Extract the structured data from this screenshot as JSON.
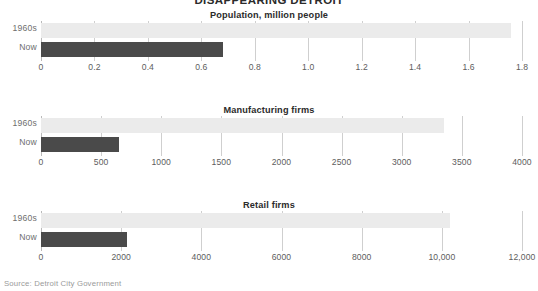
{
  "title": "DISAPPEARING DETROIT",
  "source": "Source: Detroit City Government",
  "series_labels": {
    "old": "1960s",
    "now": "Now"
  },
  "chart_data": [
    {
      "type": "bar",
      "orientation": "horizontal",
      "title": "Population, million people",
      "xlabel": "",
      "ylabel": "",
      "categories": [
        "1960s",
        "Now"
      ],
      "values": [
        1.76,
        0.68
      ],
      "series": [
        {
          "name": "1960s",
          "values": [
            1.76
          ],
          "color": "#ebebeb"
        },
        {
          "name": "Now",
          "values": [
            0.68
          ],
          "color": "#4a4a4a"
        }
      ],
      "xlim": [
        0,
        1.8
      ],
      "xticks": [
        0,
        0.2,
        0.4,
        0.6,
        0.8,
        1.0,
        1.2,
        1.4,
        1.6,
        1.8
      ],
      "xticklabels": [
        "0",
        "0.2",
        "0.4",
        "0.6",
        "0.8",
        "1.0",
        "1.2",
        "1.4",
        "1.6",
        "1.8"
      ],
      "grid": true,
      "legend": "none"
    },
    {
      "type": "bar",
      "orientation": "horizontal",
      "title": "Manufacturing firms",
      "xlabel": "",
      "ylabel": "",
      "categories": [
        "1960s",
        "Now"
      ],
      "values": [
        3350,
        650
      ],
      "series": [
        {
          "name": "1960s",
          "values": [
            3350
          ],
          "color": "#ebebeb"
        },
        {
          "name": "Now",
          "values": [
            650
          ],
          "color": "#4a4a4a"
        }
      ],
      "xlim": [
        0,
        4000
      ],
      "xticks": [
        0,
        500,
        1000,
        1500,
        2000,
        2500,
        3000,
        3500,
        4000
      ],
      "xticklabels": [
        "0",
        "500",
        "1000",
        "1500",
        "2000",
        "2500",
        "3000",
        "3500",
        "4000"
      ],
      "grid": true,
      "legend": "none"
    },
    {
      "type": "bar",
      "orientation": "horizontal",
      "title": "Retail firms",
      "xlabel": "",
      "ylabel": "",
      "categories": [
        "1960s",
        "Now"
      ],
      "values": [
        10200,
        2150
      ],
      "series": [
        {
          "name": "1960s",
          "values": [
            10200
          ],
          "color": "#ebebeb"
        },
        {
          "name": "Now",
          "values": [
            2150
          ],
          "color": "#4a4a4a"
        }
      ],
      "xlim": [
        0,
        12000
      ],
      "xticks": [
        0,
        2000,
        4000,
        6000,
        8000,
        10000,
        12000
      ],
      "xticklabels": [
        "0",
        "2000",
        "4000",
        "6000",
        "8000",
        "10,000",
        "12,000"
      ],
      "grid": true,
      "legend": "none"
    }
  ],
  "colors": {
    "bar_old": "#ebebeb",
    "bar_now": "#4a4a4a",
    "gridline": "#cfcfcf",
    "text": "#3a3a3a",
    "source_text": "#9a9a9a",
    "background": "#ffffff"
  }
}
